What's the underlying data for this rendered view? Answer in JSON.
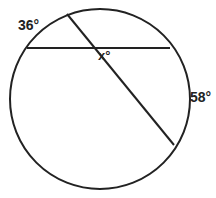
{
  "diagram": {
    "type": "circle-intersecting-chords",
    "stroke_color": "#222222",
    "background_color": "#ffffff",
    "circle": {
      "cx": 100,
      "cy": 99,
      "r": 90
    },
    "chords": [
      {
        "name": "horizontal-chord",
        "x1": 27,
        "y1": 48,
        "x2": 170,
        "y2": 48
      },
      {
        "name": "diagonal-chord",
        "x1": 67,
        "y1": 14,
        "x2": 174,
        "y2": 145
      }
    ],
    "labels": {
      "arc_top_left": "36°",
      "angle_x": "x°",
      "arc_right": "58°"
    }
  }
}
